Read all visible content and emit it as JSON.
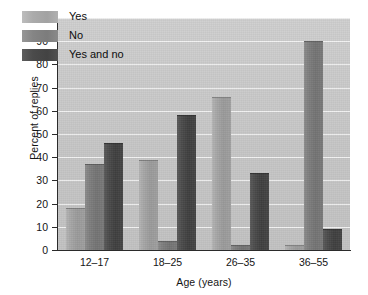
{
  "chart_data": {
    "type": "bar",
    "title": "",
    "xlabel": "Age (years)",
    "ylabel": "Percent of replies",
    "categories": [
      "12–17",
      "18–25",
      "26–35",
      "36–55"
    ],
    "series": [
      {
        "name": "Yes",
        "values": [
          18,
          39,
          66,
          2
        ]
      },
      {
        "name": "No",
        "values": [
          37,
          4,
          2,
          90
        ]
      },
      {
        "name": "Yes and no",
        "values": [
          46,
          58,
          33,
          9
        ]
      }
    ],
    "ylim": [
      0,
      100
    ],
    "yticks": [
      0,
      10,
      20,
      30,
      40,
      50,
      60,
      70,
      80,
      90,
      100
    ],
    "ytick_labels": [
      "0",
      "10",
      "20",
      "30",
      "40",
      "50",
      "60",
      "70",
      "80",
      "90",
      "100"
    ],
    "grid": true,
    "legend_position": "top-left",
    "legend_entries": [
      "Yes",
      "No",
      "Yes and no"
    ],
    "colors": {
      "plot_background": "#c9c9c9",
      "gridline": "#f3f3f3",
      "axis": "#2b2b2b",
      "series_yes": "#a6a6a6",
      "series_no": "#7e7e7e",
      "series_yes_and_no": "#4b4b4b",
      "text": "#141414",
      "figure_background": "#ffffff"
    }
  }
}
